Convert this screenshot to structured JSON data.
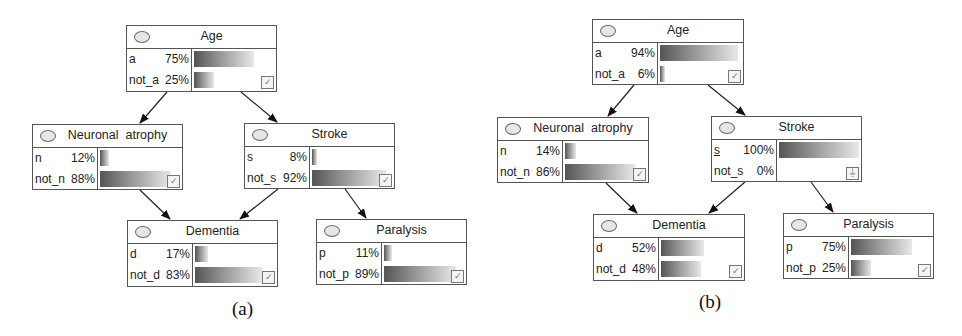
{
  "panels": [
    {
      "caption": "(a)",
      "nodes": {
        "age": {
          "title": "Age",
          "states": [
            {
              "name": "a",
              "pct": "75%",
              "value": 75
            },
            {
              "name": "not_a",
              "pct": "25%",
              "value": 25
            }
          ],
          "indicator": "✓"
        },
        "neuronal": {
          "title": "Neuronal  atrophy",
          "states": [
            {
              "name": "n",
              "pct": "12%",
              "value": 12
            },
            {
              "name": "not_n",
              "pct": "88%",
              "value": 88
            }
          ],
          "indicator": "✓"
        },
        "stroke": {
          "title": "Stroke",
          "states": [
            {
              "name": "s",
              "pct": "8%",
              "value": 8
            },
            {
              "name": "not_s",
              "pct": "92%",
              "value": 92
            }
          ],
          "indicator": "✓"
        },
        "dementia": {
          "title": "Dementia",
          "states": [
            {
              "name": "d",
              "pct": "17%",
              "value": 17
            },
            {
              "name": "not_d",
              "pct": "83%",
              "value": 83
            }
          ],
          "indicator": "✓"
        },
        "paralysis": {
          "title": "Paralysis",
          "states": [
            {
              "name": "p",
              "pct": "11%",
              "value": 11
            },
            {
              "name": "not_p",
              "pct": "89%",
              "value": 89
            }
          ],
          "indicator": "✓"
        }
      }
    },
    {
      "caption": "(b)",
      "nodes": {
        "age": {
          "title": "Age",
          "states": [
            {
              "name": "a",
              "pct": "94%",
              "value": 94
            },
            {
              "name": "not_a",
              "pct": "6%",
              "value": 6
            }
          ],
          "indicator": "✓"
        },
        "neuronal": {
          "title": "Neuronal  atrophy",
          "states": [
            {
              "name": "n",
              "pct": "14%",
              "value": 14
            },
            {
              "name": "not_n",
              "pct": "86%",
              "value": 86
            }
          ],
          "indicator": "✓"
        },
        "stroke": {
          "title": "Stroke",
          "states": [
            {
              "name": "s",
              "pct": "100%",
              "value": 100
            },
            {
              "name": "not_s",
              "pct": "0%",
              "value": 0
            }
          ],
          "indicator": "⏚",
          "evidence_state": "s"
        },
        "dementia": {
          "title": "Dementia",
          "states": [
            {
              "name": "d",
              "pct": "52%",
              "value": 52
            },
            {
              "name": "not_d",
              "pct": "48%",
              "value": 48
            }
          ],
          "indicator": "✓"
        },
        "paralysis": {
          "title": "Paralysis",
          "states": [
            {
              "name": "p",
              "pct": "75%",
              "value": 75
            },
            {
              "name": "not_p",
              "pct": "25%",
              "value": 25
            }
          ],
          "indicator": "✓"
        }
      }
    }
  ],
  "edges": [
    [
      "Age",
      "Neuronal atrophy"
    ],
    [
      "Age",
      "Stroke"
    ],
    [
      "Neuronal atrophy",
      "Dementia"
    ],
    [
      "Stroke",
      "Dementia"
    ],
    [
      "Stroke",
      "Paralysis"
    ]
  ]
}
